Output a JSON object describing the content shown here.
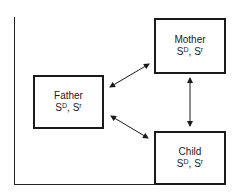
{
  "diagram": {
    "nodes": [
      {
        "id": "mother",
        "name": "Mother",
        "stat_base1": "S",
        "stat_sup1": "D",
        "stat_sep": ", ",
        "stat_base2": "S",
        "stat_sup2": "r"
      },
      {
        "id": "father",
        "name": "Father",
        "stat_base1": "S",
        "stat_sup1": "D",
        "stat_sep": ", ",
        "stat_base2": "S",
        "stat_sup2": "r"
      },
      {
        "id": "child",
        "name": "Child",
        "stat_base1": "S",
        "stat_sup1": "D",
        "stat_sep": ", ",
        "stat_base2": "S",
        "stat_sup2": "r"
      }
    ],
    "edges": [
      {
        "from": "father",
        "to": "mother",
        "type": "bidirectional"
      },
      {
        "from": "father",
        "to": "child",
        "type": "bidirectional"
      },
      {
        "from": "mother",
        "to": "child",
        "type": "bidirectional"
      }
    ],
    "colors": {
      "line": "#1a1a1a",
      "background": "#ffffff"
    }
  }
}
